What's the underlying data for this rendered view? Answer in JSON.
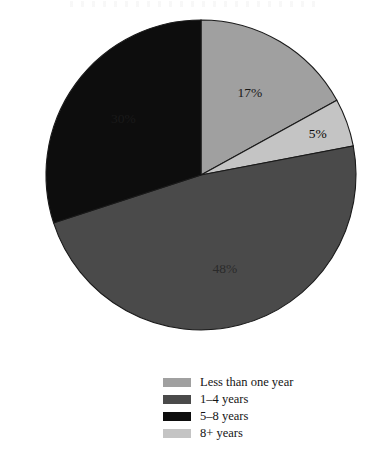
{
  "chart_data": {
    "type": "pie",
    "title": "",
    "subtitle": "",
    "xlabel": "",
    "ylabel": "",
    "grid": false,
    "legend_position": "bottom-center",
    "units": "percent",
    "categories": [
      "Less than one year",
      "1–4 years",
      "5–8 years",
      "8+ years"
    ],
    "values": [
      17,
      48,
      30,
      5
    ],
    "slice_labels": [
      "17%",
      "48%",
      "30%",
      "5%"
    ],
    "colors": [
      "#a0a0a0",
      "#4a4a4a",
      "#0d0d0d",
      "#c4c4c4"
    ],
    "slices": [
      {
        "label": "Less than one year",
        "value": 17,
        "display": "17%",
        "color": "#a0a0a0",
        "start_angle_deg": 0,
        "end_angle_deg": 61.2
      },
      {
        "label": "8+ years",
        "value": 5,
        "display": "5%",
        "color": "#c4c4c4",
        "start_angle_deg": 61.2,
        "end_angle_deg": 79.2
      },
      {
        "label": "1–4 years",
        "value": 48,
        "display": "48%",
        "color": "#4a4a4a",
        "start_angle_deg": 79.2,
        "end_angle_deg": 252.0
      },
      {
        "label": "5–8 years",
        "value": 30,
        "display": "30%",
        "color": "#0d0d0d",
        "start_angle_deg": 252.0,
        "end_angle_deg": 360.0
      }
    ],
    "geometry": {
      "center_x": 201,
      "center_y": 175,
      "radius": 155,
      "start_angle_deg": 0,
      "direction": "clockwise"
    },
    "outline_color": "#1a1a1a",
    "background": "#ffffff",
    "label_text_colors": [
      "#1a1a1a",
      "#0a0a0a",
      "#2a2a2a",
      "#1a1a1a"
    ]
  },
  "legend": {
    "items": [
      {
        "label": "Less than one year",
        "color": "#a0a0a0"
      },
      {
        "label": "1–4 years",
        "color": "#4a4a4a"
      },
      {
        "label": "5–8 years",
        "color": "#0d0d0d"
      },
      {
        "label": "8+ years",
        "color": "#c4c4c4"
      }
    ]
  }
}
